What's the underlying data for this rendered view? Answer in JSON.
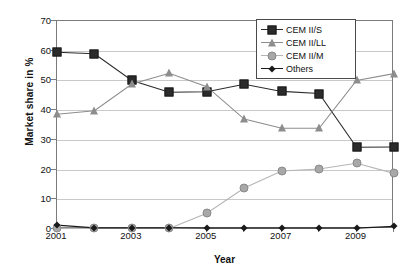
{
  "chart_data": {
    "type": "line",
    "title": "",
    "xlabel": "Year",
    "ylabel": "Market share in %",
    "xlim": [
      2001,
      2010
    ],
    "ylim": [
      0,
      70
    ],
    "ytick_step": 10,
    "grid": true,
    "legend_position": "top-right",
    "x": [
      2001,
      2002,
      2003,
      2004,
      2005,
      2006,
      2007,
      2008,
      2009,
      2010
    ],
    "xtick_labels": [
      "2001",
      "2003",
      "2005",
      "2007",
      "2009"
    ],
    "xtick_values": [
      2001,
      2003,
      2005,
      2007,
      2009
    ],
    "ytick_labels": [
      "0",
      "10",
      "20",
      "30",
      "40",
      "50",
      "60",
      "70"
    ],
    "series": [
      {
        "name": "CEM II/S",
        "marker": "square",
        "color": "#2b2b2b",
        "line_color": "#2b2b2b",
        "values": [
          59.5,
          59.0,
          50.0,
          46.0,
          46.2,
          48.7,
          46.3,
          45.6,
          27.5,
          27.6
        ]
      },
      {
        "name": "CEM II/LL",
        "marker": "triangle",
        "color": "#8d8d8d",
        "line_color": "#8d8d8d",
        "values": [
          38.6,
          39.8,
          48.8,
          52.4,
          47.9,
          37.0,
          33.9,
          33.9,
          50.0,
          52.3
        ]
      },
      {
        "name": "CEM II/M",
        "marker": "circle",
        "color": "#a8a8a8",
        "line_color": "#b5b5b5",
        "values": [
          0.2,
          0.2,
          0.2,
          0.2,
          5.3,
          13.8,
          19.5,
          20.2,
          22.1,
          18.7
        ]
      },
      {
        "name": "Others",
        "marker": "diamond",
        "color": "#1a1a1a",
        "line_color": "#1a1a1a",
        "values": [
          1.3,
          0.4,
          0.4,
          0.4,
          0.3,
          0.3,
          0.3,
          0.3,
          0.3,
          0.9
        ]
      }
    ]
  },
  "legend": {
    "items": [
      {
        "label": "CEM II/S"
      },
      {
        "label": "CEM II/LL"
      },
      {
        "label": "CEM II/M"
      },
      {
        "label": "Others"
      }
    ]
  },
  "axes": {
    "y_title": "Market share in %",
    "x_title": "Year"
  }
}
